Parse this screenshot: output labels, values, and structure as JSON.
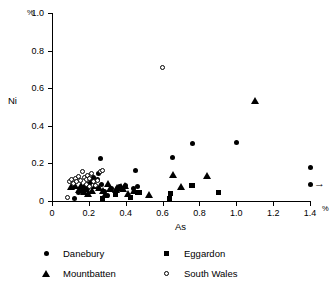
{
  "chart_data": {
    "type": "scatter",
    "title": "",
    "xlabel": "As",
    "ylabel": "Ni",
    "x_unit": "%",
    "y_unit": "%",
    "xlim": [
      0,
      1.4
    ],
    "ylim": [
      0,
      1.0
    ],
    "grid": false,
    "legend_position": "below-axes",
    "xticks": [
      "0",
      "0.2",
      "0.4",
      "0.6",
      "0.8",
      "1.0",
      "1.2",
      "1.4"
    ],
    "xtick_values": [
      0,
      0.2,
      0.4,
      0.6,
      0.8,
      1.0,
      1.2,
      1.4
    ],
    "yticks": [
      "0",
      "0.2",
      "0.4",
      "0.6",
      "0.8",
      "1.0"
    ],
    "ytick_values": [
      0,
      0.2,
      0.4,
      0.6,
      0.8,
      1.0
    ],
    "annotations": [
      {
        "text": "off-scale-arrow",
        "x": 1.4,
        "y": 0.09,
        "symbol": "→"
      }
    ],
    "series": [
      {
        "name": "Danebury",
        "marker": "filled-circle",
        "color": "#000000",
        "points": [
          [
            0.12,
            0.015
          ],
          [
            0.145,
            0.045
          ],
          [
            0.165,
            0.055
          ],
          [
            0.175,
            0.075
          ],
          [
            0.185,
            0.085
          ],
          [
            0.195,
            0.065
          ],
          [
            0.205,
            0.095
          ],
          [
            0.215,
            0.105
          ],
          [
            0.225,
            0.125
          ],
          [
            0.245,
            0.115
          ],
          [
            0.255,
            0.145
          ],
          [
            0.265,
            0.225
          ],
          [
            0.27,
            0.09
          ],
          [
            0.285,
            0.05
          ],
          [
            0.3,
            0.03
          ],
          [
            0.325,
            0.065
          ],
          [
            0.365,
            0.075
          ],
          [
            0.4,
            0.085
          ],
          [
            0.44,
            0.065
          ],
          [
            0.455,
            0.16
          ],
          [
            0.465,
            0.075
          ],
          [
            0.655,
            0.23
          ],
          [
            0.76,
            0.305
          ],
          [
            1.0,
            0.31
          ],
          [
            1.4,
            0.18
          ],
          [
            1.4,
            0.09
          ]
        ]
      },
      {
        "name": "Eggardon",
        "marker": "filled-square",
        "color": "#000000",
        "points": [
          [
            0.275,
            0.015
          ],
          [
            0.345,
            0.035
          ],
          [
            0.425,
            0.02
          ],
          [
            0.465,
            0.045
          ],
          [
            0.475,
            0.045
          ],
          [
            0.635,
            0.015
          ],
          [
            0.645,
            0.04
          ],
          [
            0.755,
            0.08
          ],
          [
            0.765,
            0.08
          ],
          [
            0.905,
            0.045
          ]
        ]
      },
      {
        "name": "Mountbatten",
        "marker": "filled-triangle",
        "color": "#000000",
        "points": [
          [
            0.105,
            0.075
          ],
          [
            0.125,
            0.085
          ],
          [
            0.145,
            0.06
          ],
          [
            0.155,
            0.08
          ],
          [
            0.175,
            0.05
          ],
          [
            0.185,
            0.065
          ],
          [
            0.195,
            0.04
          ],
          [
            0.215,
            0.055
          ],
          [
            0.235,
            0.085
          ],
          [
            0.255,
            0.07
          ],
          [
            0.275,
            0.055
          ],
          [
            0.285,
            0.035
          ],
          [
            0.305,
            0.095
          ],
          [
            0.315,
            0.065
          ],
          [
            0.345,
            0.06
          ],
          [
            0.355,
            0.07
          ],
          [
            0.375,
            0.075
          ],
          [
            0.385,
            0.065
          ],
          [
            0.395,
            0.08
          ],
          [
            0.415,
            0.04
          ],
          [
            0.445,
            0.055
          ],
          [
            0.525,
            0.035
          ],
          [
            0.655,
            0.14
          ],
          [
            0.7,
            0.075
          ],
          [
            0.84,
            0.135
          ],
          [
            1.1,
            0.535
          ]
        ]
      },
      {
        "name": "South Wales",
        "marker": "open-circle",
        "color": "#000000",
        "points": [
          [
            0.085,
            0.02
          ],
          [
            0.095,
            0.105
          ],
          [
            0.105,
            0.115
          ],
          [
            0.115,
            0.095
          ],
          [
            0.125,
            0.12
          ],
          [
            0.135,
            0.105
          ],
          [
            0.145,
            0.13
          ],
          [
            0.155,
            0.11
          ],
          [
            0.165,
            0.155
          ],
          [
            0.175,
            0.125
          ],
          [
            0.185,
            0.115
          ],
          [
            0.185,
            0.09
          ],
          [
            0.195,
            0.135
          ],
          [
            0.205,
            0.12
          ],
          [
            0.205,
            0.075
          ],
          [
            0.215,
            0.145
          ],
          [
            0.225,
            0.105
          ],
          [
            0.235,
            0.085
          ],
          [
            0.245,
            0.11
          ],
          [
            0.265,
            0.155
          ],
          [
            0.275,
            0.16
          ],
          [
            0.6,
            0.71
          ]
        ]
      }
    ]
  },
  "legend": {
    "entries": [
      {
        "label": "Danebury",
        "marker": "filled-circle"
      },
      {
        "label": "Eggardon",
        "marker": "filled-square"
      },
      {
        "label": "Mountbatten",
        "marker": "filled-triangle"
      },
      {
        "label": "South Wales",
        "marker": "open-circle"
      }
    ]
  }
}
